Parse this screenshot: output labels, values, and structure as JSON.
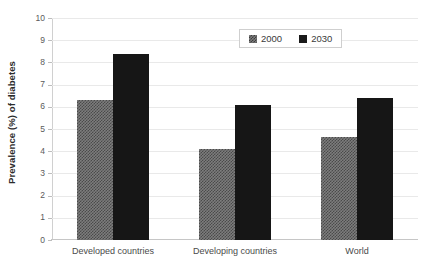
{
  "chart_data": {
    "type": "bar",
    "title": "",
    "xlabel": "",
    "ylabel": "Prevalence (%) of diabetes",
    "categories": [
      "Developed countries",
      "Developing countries",
      "World"
    ],
    "series": [
      {
        "name": "2000",
        "values": [
          6.3,
          4.1,
          4.65
        ],
        "color": "#7d7d7d",
        "pattern": "checkerboard"
      },
      {
        "name": "2030",
        "values": [
          8.4,
          6.1,
          6.4
        ],
        "color": "#161616",
        "pattern": "solid"
      }
    ],
    "ylim": [
      0,
      10
    ],
    "yticks": [
      0,
      1,
      2,
      3,
      4,
      5,
      6,
      7,
      8,
      9,
      10
    ],
    "ytick_labels": [
      "0",
      "1",
      "2",
      "3",
      "4",
      "5",
      "6",
      "7",
      "8",
      "9",
      "10"
    ],
    "grid": true,
    "legend_position": "top-center"
  },
  "axes": {
    "y_title": "Prevalence (%) of diabetes"
  },
  "legend": {
    "entries": [
      {
        "label": "2000",
        "swatch": "legend-swatch-2000"
      },
      {
        "label": "2030",
        "swatch": "legend-swatch-2030"
      }
    ]
  }
}
